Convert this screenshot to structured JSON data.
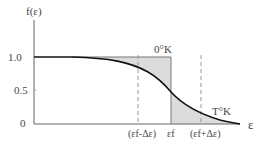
{
  "diagram": {
    "y_axis_label": "f(ε)",
    "x_axis_label": "ε",
    "y_ticks": [
      "1.0",
      "0.5",
      "0"
    ],
    "x_ticks": [
      "(εf-Δε)",
      "εf",
      "(εf+Δε)"
    ],
    "curve_labels": {
      "zero_k": "0°K",
      "t_k": "T°K"
    },
    "colors": {
      "curve": "#111111",
      "fill": "#dcdcdc",
      "axis": "#666666",
      "dashed": "#999999"
    }
  }
}
